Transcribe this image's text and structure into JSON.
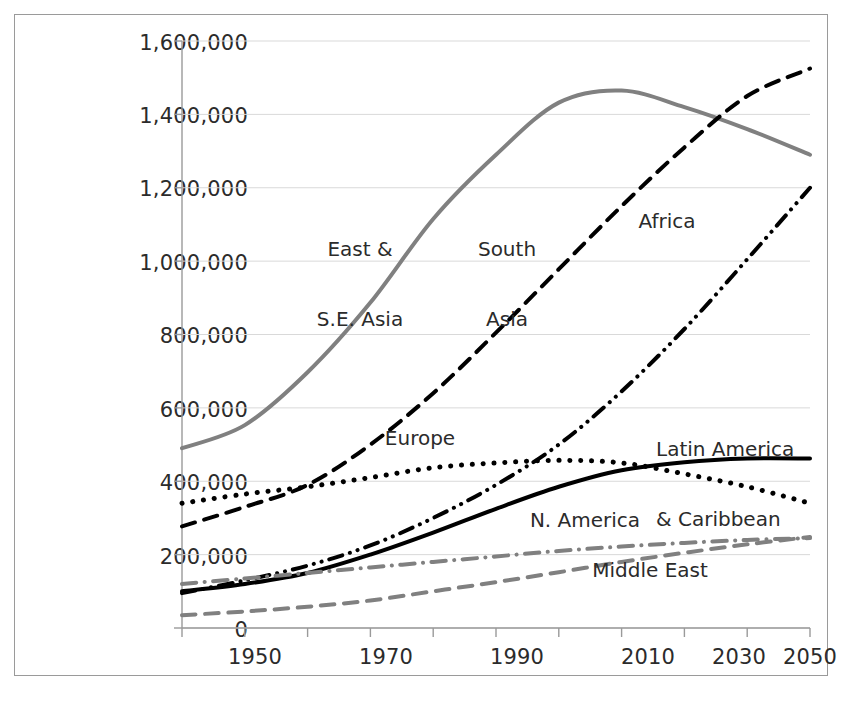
{
  "chart_data": {
    "type": "line",
    "title": "",
    "subtitle": "",
    "xlabel": "",
    "ylabel": "",
    "xlim": [
      1950,
      2050
    ],
    "ylim": [
      0,
      1600000
    ],
    "grid": true,
    "legend_position": "inline-annotations",
    "x": [
      1950,
      1960,
      1970,
      1980,
      1990,
      2000,
      2010,
      2020,
      2030,
      2040,
      2050
    ],
    "xticks": [
      1950,
      1960,
      1970,
      1980,
      1990,
      2000,
      2010,
      2020,
      2030,
      2040,
      2050
    ],
    "xtick_labels": [
      "1950",
      "",
      "1970",
      "",
      "1990",
      "",
      "2010",
      "",
      "2030",
      "",
      "2050"
    ],
    "yticks": [
      0,
      200000,
      400000,
      600000,
      800000,
      1000000,
      1200000,
      1400000,
      1600000
    ],
    "ytick_labels": [
      "0",
      "200,000",
      "400,000",
      "600,000",
      "800,000",
      "1,000,000",
      "1,200,000",
      "1,400,000",
      "1,600,000"
    ],
    "series": [
      {
        "name": "East & S.E. Asia",
        "color": "#808080",
        "style": "solid",
        "width": 4,
        "values": [
          490000,
          553000,
          697000,
          887000,
          1115000,
          1290000,
          1432000,
          1465000,
          1420000,
          1360000,
          1290000
        ]
      },
      {
        "name": "South Asia",
        "color": "#000000",
        "style": "dashed",
        "width": 4,
        "values": [
          277000,
          330000,
          390000,
          500000,
          640000,
          805000,
          978000,
          1150000,
          1310000,
          1450000,
          1525000
        ]
      },
      {
        "name": "Africa",
        "color": "#000000",
        "style": "dash-dot-dot",
        "width": 4,
        "values": [
          95000,
          130000,
          170000,
          225000,
          300000,
          390000,
          500000,
          645000,
          815000,
          1005000,
          1200000
        ]
      },
      {
        "name": "Europe",
        "color": "#000000",
        "style": "dotted",
        "width": 5,
        "values": [
          340000,
          365000,
          385000,
          410000,
          437000,
          450000,
          457000,
          450000,
          420000,
          385000,
          340000
        ]
      },
      {
        "name": "Latin America & Caribbean",
        "color": "#000000",
        "style": "solid",
        "width": 4,
        "values": [
          100000,
          120000,
          150000,
          200000,
          260000,
          325000,
          385000,
          430000,
          452000,
          462000,
          462000
        ]
      },
      {
        "name": "N. America",
        "color": "#808080",
        "style": "dash-dot",
        "width": 4,
        "values": [
          120000,
          135000,
          150000,
          165000,
          180000,
          195000,
          210000,
          222000,
          232000,
          240000,
          245000
        ]
      },
      {
        "name": "Middle East",
        "color": "#808080",
        "style": "dashed",
        "width": 4,
        "values": [
          35000,
          45000,
          58000,
          75000,
          100000,
          125000,
          152000,
          180000,
          205000,
          228000,
          248000
        ]
      }
    ],
    "annotations": [
      {
        "text": "East &\nS.E. Asia",
        "series": "East & S.E. Asia"
      },
      {
        "text": "South\nAsia",
        "series": "South Asia"
      },
      {
        "text": "Africa",
        "series": "Africa"
      },
      {
        "text": "Europe",
        "series": "Europe"
      },
      {
        "text": "Latin America\n& Caribbean",
        "series": "Latin America & Caribbean"
      },
      {
        "text": "N. America",
        "series": "N. America"
      },
      {
        "text": "Middle East",
        "series": "Middle East"
      }
    ]
  },
  "labels": {
    "east_se_asia_line1": "East &",
    "east_se_asia_line2": "S.E. Asia",
    "south_asia_line1": "South",
    "south_asia_line2": "Asia",
    "africa": "Africa",
    "europe": "Europe",
    "latin_america_line1": "Latin America",
    "latin_america_line2": "& Caribbean",
    "n_america": "N. America",
    "middle_east": "Middle East"
  },
  "axis": {
    "y": {
      "t0": "1,600,000",
      "t1": "1,400,000",
      "t2": "1,200,000",
      "t3": "1,000,000",
      "t4": "800,000",
      "t5": "600,000",
      "t6": "400,000",
      "t7": "200,000",
      "t8": "0"
    },
    "x": {
      "t0": "1950",
      "t1": "1970",
      "t2": "1990",
      "t3": "2010",
      "t4": "2030",
      "t5": "2050"
    }
  }
}
